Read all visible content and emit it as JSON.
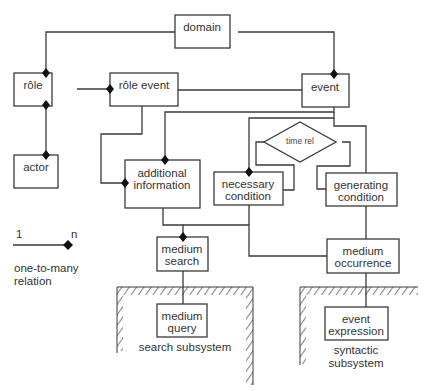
{
  "diagram": {
    "type": "entity-relationship",
    "entities": {
      "domain": "domain",
      "role": "rôle",
      "actor": "actor",
      "role_event": "rôle event",
      "event": "event",
      "additional_information": [
        "additional",
        "information"
      ],
      "time_rel": "time rel",
      "necessary_condition": [
        "necessary",
        "condition"
      ],
      "generating_condition": [
        "generating",
        "condition"
      ],
      "medium_search": [
        "medium",
        "search"
      ],
      "medium_occurrence": [
        "medium",
        "occurrence"
      ],
      "medium_query": [
        "medium",
        "query"
      ],
      "event_expression": [
        "event",
        "expression"
      ]
    },
    "subsystems": {
      "search": "search subsystem",
      "syntactic": [
        "syntactic",
        "subsystem"
      ]
    },
    "legend": {
      "one": "1",
      "many": "n",
      "caption": [
        "one-to-many",
        "relation"
      ]
    },
    "relations": [
      {
        "from": "domain",
        "to": "rôle",
        "type": "one-to-many"
      },
      {
        "from": "domain",
        "to": "event",
        "type": "one-to-many"
      },
      {
        "from": "actor",
        "to": "rôle",
        "type": "one-to-many"
      },
      {
        "from": "rôle",
        "to": "actor",
        "type": "one-to-many"
      },
      {
        "from": "rôle",
        "to": "rôle event",
        "type": "one-to-many"
      },
      {
        "from": "event",
        "to": "rôle event",
        "type": "association"
      },
      {
        "from": "rôle event",
        "to": "additional information",
        "type": "one-to-many"
      },
      {
        "from": "event",
        "to": "additional information",
        "type": "one-to-many"
      },
      {
        "from": "event",
        "to": "necessary condition",
        "type": "one-to-many"
      },
      {
        "from": "event",
        "to": "generating condition",
        "type": "association"
      },
      {
        "from": "time rel",
        "to": "necessary condition",
        "type": "association"
      },
      {
        "from": "time rel",
        "to": "generating condition",
        "type": "association"
      },
      {
        "from": "additional information",
        "to": "medium search",
        "type": "one-to-many"
      },
      {
        "from": "necessary condition",
        "to": "medium search",
        "type": "one-to-many"
      },
      {
        "from": "necessary condition",
        "to": "medium occurrence",
        "type": "association"
      },
      {
        "from": "generating condition",
        "to": "medium occurrence",
        "type": "association"
      },
      {
        "from": "medium search",
        "to": "medium query",
        "type": "association"
      },
      {
        "from": "medium occurrence",
        "to": "event expression",
        "type": "association"
      }
    ]
  }
}
